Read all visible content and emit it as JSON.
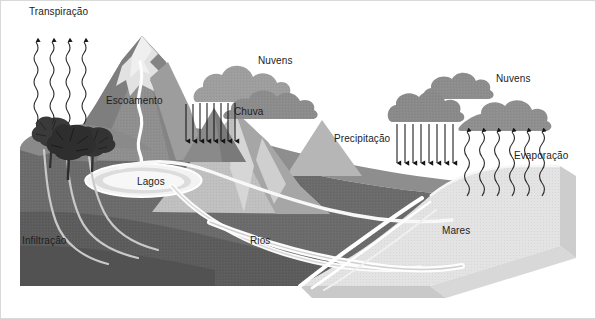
{
  "diagram": {
    "language": "pt-BR",
    "background_color": "#ffffff",
    "border_color": "#d9d9d9",
    "text_color": "#1c1c1c"
  },
  "labels": {
    "transpiracao": "Transpiração",
    "escoamento": "Escoamento",
    "nuvens_left": "Nuvens",
    "chuva": "Chuva",
    "nuvens_right": "Nuvens",
    "precipitacao": "Precipitação",
    "evaporacao": "Evaporação",
    "lagos": "Lagos",
    "rios": "Rios",
    "infiltracao": "Infiltração",
    "mares": "Mares"
  },
  "palette": {
    "snow": "#e7e7e7",
    "peak_light": "#d2d2d2",
    "mountain_mid": "#9a9a9a",
    "mountain_dark": "#7f7f7f",
    "mountain_darker": "#6e6e6e",
    "ground_top": "#8e8e8e",
    "ground_cut": "#6b6b6b",
    "ground_cut_dark": "#5a5a5a",
    "sea": "#e3e3e3",
    "sea_side": "#cdcdcd",
    "water_white": "#fdfdfd",
    "cloud": "#8d8d8d",
    "cloud_light": "#b4b4b4",
    "tree": "#3c3c3c",
    "arrow": "#1a1a1a"
  },
  "elements": {
    "transpiration_arrows": 4,
    "rain_arrows_left": 8,
    "precipitation_arrows_right": 8,
    "evaporation_arrows": 6,
    "trees": 3,
    "clouds_left": 2,
    "clouds_right": 3
  }
}
